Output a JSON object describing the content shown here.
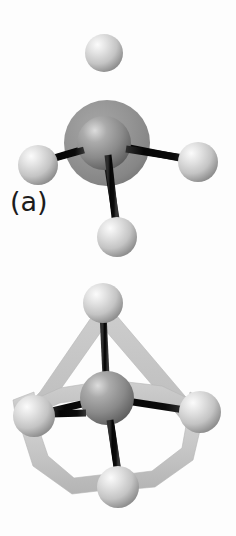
{
  "figure": {
    "background_color": "#fdfdfd",
    "panels": [
      {
        "id": "a",
        "label": "(a)",
        "caption_position": "bottom-left",
        "description": "central atom with spherical electron shell and four ligand atoms",
        "shell": {
          "type": "sphere-shell",
          "center": [
            107,
            143
          ],
          "radius": 43,
          "color": "#8f8f8f",
          "edge_color": "#7a7a7a"
        },
        "central_atom": {
          "center": [
            104,
            143
          ],
          "radius": 27,
          "color": "#8a8a8a",
          "highlight_color": "#d8d8d8",
          "shadow_color": "#5a5a5a"
        },
        "ligand_atoms": [
          {
            "name": "top",
            "center": [
              104,
              53
            ],
            "radius": 19
          },
          {
            "name": "left",
            "center": [
              38,
              165
            ],
            "radius": 20
          },
          {
            "name": "right",
            "center": [
              198,
              162
            ],
            "radius": 20
          },
          {
            "name": "bottom",
            "center": [
              117,
              237
            ],
            "radius": 20
          }
        ],
        "bonds": [
          {
            "from": "central",
            "to": "top",
            "width": 7
          },
          {
            "from": "central",
            "to": "left",
            "width": 7
          },
          {
            "from": "central",
            "to": "right",
            "width": 7
          },
          {
            "from": "central",
            "to": "bottom",
            "width": 7
          }
        ]
      },
      {
        "id": "b",
        "label": "(b)",
        "caption_position": "bottom-left",
        "description": "central atom with tetrahedral cage framework and four ligand atoms",
        "cage": {
          "type": "tetrahedron-frame",
          "color": "#c6c6c6",
          "edge_color": "#b0b0b0",
          "band_width": 17
        },
        "central_atom": {
          "center": [
            107,
            398
          ],
          "radius": 27,
          "color": "#8a8a8a",
          "highlight_color": "#d8d8d8",
          "shadow_color": "#5a5a5a"
        },
        "ligand_atoms": [
          {
            "name": "top",
            "center": [
              103,
              303
            ],
            "radius": 20
          },
          {
            "name": "left",
            "center": [
              34,
              416
            ],
            "radius": 21
          },
          {
            "name": "right",
            "center": [
              200,
              412
            ],
            "radius": 21
          },
          {
            "name": "bottom",
            "center": [
              118,
              487
            ],
            "radius": 21
          }
        ],
        "bonds": [
          {
            "from": "central",
            "to": "top",
            "width": 7
          },
          {
            "from": "central",
            "to": "left",
            "width": 7
          },
          {
            "from": "central",
            "to": "right",
            "width": 7
          },
          {
            "from": "central",
            "to": "bottom",
            "width": 7
          }
        ]
      }
    ],
    "colors": {
      "ligand_sphere": "#c9c9c9",
      "ligand_highlight": "#f2f2f2",
      "ligand_shadow": "#8d8d8d",
      "central_sphere": "#8a8a8a",
      "bond_rod": "#090909",
      "bond_rod_edge": "#3a3a3a",
      "label_text": "#1c1c1c"
    }
  }
}
